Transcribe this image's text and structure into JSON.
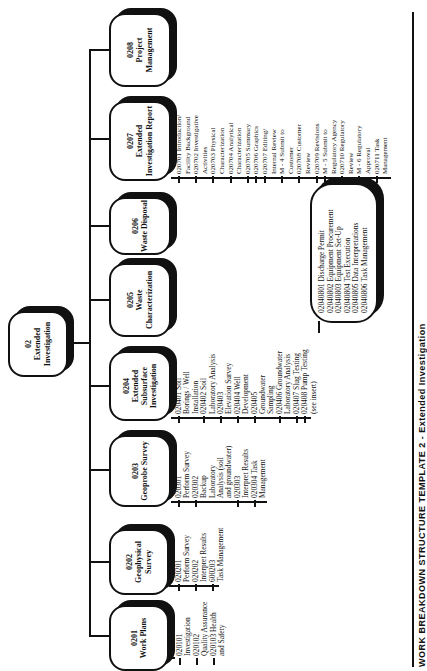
{
  "root": {
    "code": "02",
    "title": "Extended Investigation"
  },
  "boxes": [
    {
      "code": "0201",
      "title": "Work Plans",
      "items": [
        {
          "text": "020101",
          "tick": true
        },
        {
          "text": "Investigation",
          "tick": false
        },
        {
          "text": "020102",
          "tick": true
        },
        {
          "text": "Quality Assurance",
          "tick": false
        },
        {
          "text": "020103 Health",
          "tick": true
        },
        {
          "text": "and Safety",
          "tick": false
        }
      ]
    },
    {
      "code": "0202",
      "title": "Geophysical Survey",
      "items": [
        {
          "text": "020201",
          "tick": true
        },
        {
          "text": "Perform Survey",
          "tick": false
        },
        {
          "text": "020202",
          "tick": true
        },
        {
          "text": "Interpret Results",
          "tick": false
        },
        {
          "text": "600203",
          "tick": true
        },
        {
          "text": "Task Management",
          "tick": false
        }
      ]
    },
    {
      "code": "0203",
      "title": "Geoprobe Survey",
      "items": [
        {
          "text": "020301",
          "tick": true
        },
        {
          "text": "Perform Survey",
          "tick": false
        },
        {
          "text": "020302",
          "tick": true
        },
        {
          "text": "Backup",
          "tick": false
        },
        {
          "text": "Laboratory",
          "tick": false
        },
        {
          "text": "Analysis (soil",
          "tick": false
        },
        {
          "text": "and groundwater)",
          "tick": false
        },
        {
          "text": "020303",
          "tick": true
        },
        {
          "text": "Interpret Results",
          "tick": false
        },
        {
          "text": "020304 Task",
          "tick": true
        },
        {
          "text": "Management",
          "tick": false
        }
      ]
    },
    {
      "code": "0204",
      "title": "Extended Subsurface Investigation",
      "items": [
        {
          "text": "020401 Soil",
          "tick": true
        },
        {
          "text": "Borings / Well",
          "tick": false
        },
        {
          "text": "Installation",
          "tick": false
        },
        {
          "text": "020402 Soil",
          "tick": true
        },
        {
          "text": "Laboratory Analysis",
          "tick": false
        },
        {
          "text": "020403",
          "tick": true
        },
        {
          "text": "Elevation Survey",
          "tick": false
        },
        {
          "text": "020404 Well",
          "tick": true
        },
        {
          "text": "Development",
          "tick": false
        },
        {
          "text": "020405",
          "tick": true
        },
        {
          "text": "Groundwater",
          "tick": false
        },
        {
          "text": "Sampling",
          "tick": false
        },
        {
          "text": "020406 Groundwater",
          "tick": true
        },
        {
          "text": "Laboratory Analysis",
          "tick": false
        },
        {
          "text": "020407 Slug Testing",
          "tick": true
        },
        {
          "text": "020408 Pump Testing",
          "tick": true
        },
        {
          "text": "(see insert)",
          "tick": false
        }
      ]
    },
    {
      "code": "0205",
      "title": "Waste Characterization",
      "items": []
    },
    {
      "code": "0206",
      "title": "Waste Disposal",
      "items": []
    },
    {
      "code": "0207",
      "title": "Extended Investigation Report",
      "items": [
        {
          "text": "020701 Introduction/",
          "tick": true
        },
        {
          "text": "Facility Background",
          "tick": false
        },
        {
          "text": "020702 Investigative",
          "tick": true
        },
        {
          "text": "Activities",
          "tick": false
        },
        {
          "text": "020703 Physical",
          "tick": true
        },
        {
          "text": "Characterization",
          "tick": false
        },
        {
          "text": "020704 Analytical",
          "tick": true
        },
        {
          "text": "Characterization",
          "tick": false
        },
        {
          "text": "020705 Summary",
          "tick": true
        },
        {
          "text": "020706 Graphics",
          "tick": true
        },
        {
          "text": "020707 Editing/",
          "tick": true
        },
        {
          "text": "Internal Review",
          "tick": false
        },
        {
          "text": "M - 4 Submit to",
          "tick": true
        },
        {
          "text": "Customer",
          "tick": false
        },
        {
          "text": "020708 Customer",
          "tick": true
        },
        {
          "text": "Review",
          "tick": false
        },
        {
          "text": "020709 Revisions",
          "tick": true
        },
        {
          "text": "M - 5 Submit to",
          "tick": true
        },
        {
          "text": "Regulatory Agency",
          "tick": false
        },
        {
          "text": "020710 Regulatory",
          "tick": true
        },
        {
          "text": "Review",
          "tick": false
        },
        {
          "text": "M - 6 Regulatory",
          "tick": true
        },
        {
          "text": "Approval",
          "tick": false
        },
        {
          "text": "020711 Task",
          "tick": true
        },
        {
          "text": "Management",
          "tick": false
        }
      ]
    },
    {
      "code": "0208",
      "title": "Project Management",
      "items": []
    }
  ],
  "insert": {
    "items": [
      "02040801 Discharge Permit",
      "02040802 Equipment Procurement",
      "02040803 Equipment Set-Up",
      "02040804 Test Execution",
      "02040805 Data Interpretations",
      "02040806 Task Management"
    ]
  },
  "caption": "WORK BREAKDOWN STRUCTURE TEMPLATE 2 - Extended Investigation"
}
